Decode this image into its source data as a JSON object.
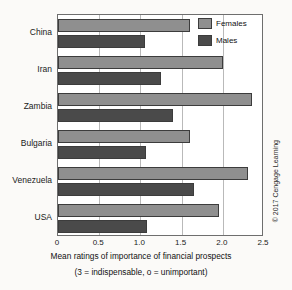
{
  "chart_data": {
    "type": "bar",
    "orientation": "horizontal",
    "title": "",
    "xlabel": "Mean ratings of importance of financial prospects",
    "xlabel_note": "(3 = indispensable, o = unimportant)",
    "ylabel": "",
    "categories": [
      "China",
      "Iran",
      "Zambia",
      "Bulgaria",
      "Venezuela",
      "USA"
    ],
    "series": [
      {
        "name": "Females",
        "color": "#8f8f8f",
        "values": [
          1.6,
          2.0,
          2.35,
          1.6,
          2.3,
          1.95
        ]
      },
      {
        "name": "Males",
        "color": "#4a4a4a",
        "values": [
          1.05,
          1.25,
          1.4,
          1.07,
          1.65,
          1.08
        ]
      }
    ],
    "xlim": [
      0,
      2.5
    ],
    "xticks": [
      0,
      0.5,
      1.0,
      1.5,
      2.0,
      2.5
    ],
    "xtick_labels": [
      "0",
      "0.5",
      "1.0",
      "1.5",
      "2.0",
      "2.5"
    ],
    "grid": true,
    "grid_axis": "x",
    "legend_position": "top-right"
  },
  "legend": {
    "items": [
      {
        "label": "Females",
        "swatch": "female"
      },
      {
        "label": "Males",
        "swatch": "male"
      }
    ]
  },
  "credit": {
    "text": "© 2017 Cengage Learning"
  },
  "colors": {
    "female_bar": "#8f8f8f",
    "male_bar": "#4a4a4a",
    "axis": "#6e6e6e",
    "grid": "#b9b9b9",
    "background": "#fbfaf8"
  }
}
